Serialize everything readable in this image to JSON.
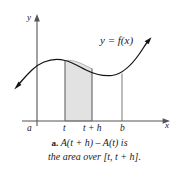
{
  "figure": {
    "kind": "calculus-area-function-diagram",
    "colors": {
      "ink": "#1a1a1a",
      "axis": "#555555",
      "curve": "#111111",
      "shaded_region_fill": "#e2e2e2",
      "shaded_region_stroke": "#9a9a9a",
      "background": "#ffffff"
    },
    "axes": {
      "y_axis_label": "y",
      "x_axis_label": "x",
      "x_axis_y_px": 121,
      "y_axis_x_px": 37
    },
    "tick_labels": [
      {
        "id": "a",
        "text": "a",
        "x_px": 31
      },
      {
        "id": "t",
        "text": "t",
        "x_px": 65
      },
      {
        "id": "t_plus_h",
        "text": "t + h",
        "x_px": 92
      },
      {
        "id": "b",
        "text": "b",
        "x_px": 122
      }
    ],
    "curve_label": "y = f(x)",
    "shaded_region": {
      "label": "area over [t, t + h]",
      "left_x_px": 65,
      "right_x_px": 92
    }
  },
  "caption": {
    "marker": "a.",
    "line1": "A(t + h) – A(t) is",
    "line2": "the area over [t, t + h]."
  }
}
